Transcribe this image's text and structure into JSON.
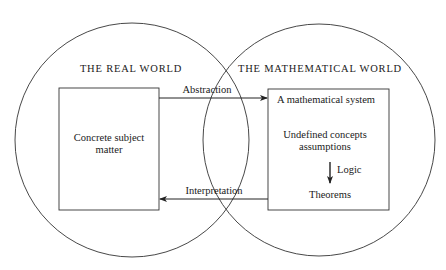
{
  "diagram": {
    "type": "venn-flow",
    "left_world": {
      "title": "THE REAL WORLD",
      "box": {
        "line1": "Concrete subject",
        "line2": "matter"
      }
    },
    "right_world": {
      "title": "THE MATHEMATICAL WORLD",
      "box": {
        "heading": "A mathematical system",
        "line1": "Undefined concepts",
        "line2": "assumptions",
        "logic_label": "Logic",
        "result": "Theorems"
      }
    },
    "arrows": {
      "top": "Abstraction",
      "bottom": "Interpretation"
    },
    "colors": {
      "stroke": "#2a2a2a",
      "background": "#ffffff"
    }
  }
}
